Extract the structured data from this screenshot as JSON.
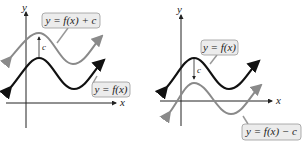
{
  "left": {
    "x_axis_label": "x",
    "y_axis_label": "y",
    "shift_label": "c",
    "upper_curve_label": "y = f(x) + c",
    "base_curve_label": "y = f(x)"
  },
  "right": {
    "x_axis_label": "x",
    "y_axis_label": "y",
    "shift_label": "c",
    "base_curve_label": "y = f(x)",
    "lower_curve_label": "y = f(x) − c"
  },
  "colors": {
    "base": "#111111",
    "shifted": "#8a8a8a",
    "box_fill": "#ececec",
    "box_stroke": "#999999"
  }
}
